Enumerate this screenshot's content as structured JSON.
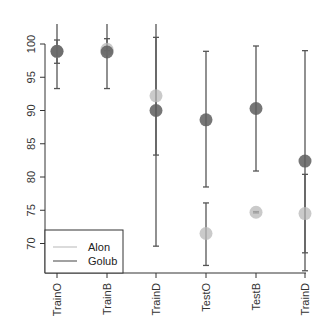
{
  "chart_data": {
    "type": "scatter",
    "title": "",
    "xlabel": "",
    "ylabel": "",
    "categories": [
      "TrainO",
      "TrainB",
      "TrainD",
      "TestO",
      "TestB",
      "TrainD"
    ],
    "ylim": [
      65.5,
      103.5
    ],
    "yticks": [
      70,
      75,
      80,
      85,
      90,
      95,
      100
    ],
    "grid": false,
    "legend": {
      "position": "bottom-left",
      "entries": [
        "Alon",
        "Golub"
      ]
    },
    "series": [
      {
        "name": "Alon",
        "color": "#c8c8c8",
        "values": [
          98.9,
          99.2,
          92.2,
          71.5,
          74.7,
          74.5
        ],
        "lower": [
          97.1,
          99.0,
          83.3,
          66.7,
          74.6,
          65.9
        ],
        "upper": [
          100.6,
          100.8,
          101.0,
          76.1,
          74.8,
          80.4
        ]
      },
      {
        "name": "Golub",
        "color": "#6e6e6e",
        "values": [
          98.9,
          98.8,
          90.0,
          88.6,
          90.3,
          82.4
        ],
        "lower": [
          93.3,
          93.3,
          69.6,
          78.5,
          80.9,
          68.6
        ],
        "upper": [
          103.5,
          103.5,
          103.5,
          98.9,
          99.7,
          99.0
        ]
      }
    ]
  }
}
